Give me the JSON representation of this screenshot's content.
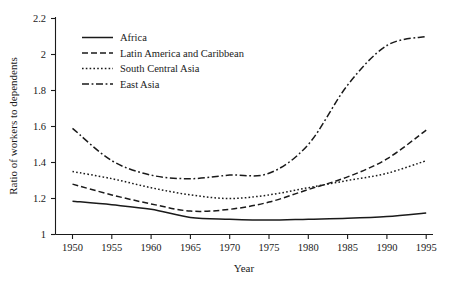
{
  "chart_data": {
    "type": "line",
    "title": "",
    "xlabel": "Year",
    "ylabel": "Ratio of workers to dependents",
    "x": [
      1950,
      1955,
      1960,
      1965,
      1970,
      1975,
      1980,
      1985,
      1990,
      1995
    ],
    "xlim": [
      1950,
      1995
    ],
    "ylim": [
      1,
      2.2
    ],
    "xticks": [
      "1950",
      "1955",
      "1960",
      "1965",
      "1970",
      "1975",
      "1980",
      "1985",
      "1990",
      "1995"
    ],
    "yticks": [
      "1",
      "1.2",
      "1.4",
      "1.6",
      "1.8",
      "2",
      "2.2"
    ],
    "grid": false,
    "legend_position": "upper-left",
    "series": [
      {
        "name": "Africa",
        "style": "solid",
        "values": [
          1.185,
          1.165,
          1.14,
          1.095,
          1.085,
          1.08,
          1.085,
          1.09,
          1.1,
          1.12
        ]
      },
      {
        "name": "Latin America and Caribbean",
        "style": "dashed",
        "values": [
          1.28,
          1.22,
          1.17,
          1.13,
          1.14,
          1.18,
          1.25,
          1.32,
          1.42,
          1.58
        ]
      },
      {
        "name": "South Central Asia",
        "style": "dotted",
        "values": [
          1.35,
          1.31,
          1.26,
          1.22,
          1.2,
          1.22,
          1.26,
          1.3,
          1.34,
          1.41
        ]
      },
      {
        "name": "East Asia",
        "style": "dashdot",
        "values": [
          1.59,
          1.41,
          1.33,
          1.31,
          1.33,
          1.34,
          1.5,
          1.83,
          2.05,
          2.1
        ]
      }
    ]
  },
  "axis": {
    "x_title": "Year",
    "y_title": "Ratio of workers to dependents"
  },
  "legend": {
    "items": [
      {
        "label": "Africa",
        "style": "solid"
      },
      {
        "label": "Latin America and Caribbean",
        "style": "dashed"
      },
      {
        "label": "South Central Asia",
        "style": "dotted"
      },
      {
        "label": "East Asia",
        "style": "dashdot"
      }
    ]
  },
  "colors": {
    "ink": "#1a1a1a",
    "background": "#ffffff"
  }
}
